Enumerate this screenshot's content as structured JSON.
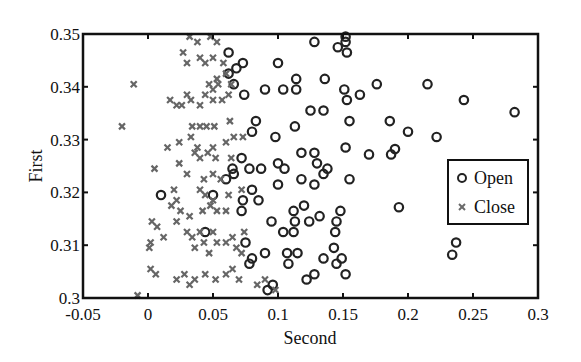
{
  "chart_data": {
    "type": "scatter",
    "title": "",
    "xlabel": "Second",
    "ylabel": "First",
    "xlim": [
      -0.05,
      0.3
    ],
    "ylim": [
      0.3,
      0.35
    ],
    "xticks": [
      -0.05,
      0,
      0.05,
      0.1,
      0.15,
      0.2,
      0.25,
      0.3
    ],
    "xtick_labels": [
      "-0.05",
      "0",
      "0.05",
      "0.1",
      "0.15",
      "0.2",
      "0.25",
      "0.3"
    ],
    "yticks": [
      0.3,
      0.31,
      0.32,
      0.33,
      0.34,
      0.35
    ],
    "ytick_labels": [
      "0.3",
      "0.31",
      "0.32",
      "0.33",
      "0.34",
      "0.35"
    ],
    "grid": false,
    "legend_position": "right-center inside",
    "legend": [
      "Open",
      "Close"
    ],
    "series": [
      {
        "name": "Open",
        "marker": "circle",
        "color": "#222222",
        "points": [
          [
            0.062,
            0.3465
          ],
          [
            0.066,
            0.3405
          ],
          [
            0.062,
            0.3425
          ],
          [
            0.073,
            0.3445
          ],
          [
            0.068,
            0.3435
          ],
          [
            0.074,
            0.3385
          ],
          [
            0.09,
            0.3395
          ],
          [
            0.104,
            0.3395
          ],
          [
            0.128,
            0.3485
          ],
          [
            0.152,
            0.3485
          ],
          [
            0.146,
            0.3475
          ],
          [
            0.152,
            0.3495
          ],
          [
            0.153,
            0.3465
          ],
          [
            0.1,
            0.3445
          ],
          [
            0.114,
            0.3415
          ],
          [
            0.114,
            0.3395
          ],
          [
            0.136,
            0.3415
          ],
          [
            0.163,
            0.3385
          ],
          [
            0.176,
            0.3405
          ],
          [
            0.151,
            0.3395
          ],
          [
            0.153,
            0.3375
          ],
          [
            0.125,
            0.3355
          ],
          [
            0.135,
            0.3355
          ],
          [
            0.155,
            0.3335
          ],
          [
            0.152,
            0.3285
          ],
          [
            0.113,
            0.3325
          ],
          [
            0.083,
            0.3335
          ],
          [
            0.098,
            0.3305
          ],
          [
            0.08,
            0.3315
          ],
          [
            0.215,
            0.3405
          ],
          [
            0.243,
            0.3375
          ],
          [
            0.282,
            0.3352
          ],
          [
            0.2,
            0.3315
          ],
          [
            0.222,
            0.3305
          ],
          [
            0.186,
            0.3335
          ],
          [
            0.17,
            0.3272
          ],
          [
            0.187,
            0.3272
          ],
          [
            0.19,
            0.3282
          ],
          [
            0.193,
            0.3172
          ],
          [
            0.237,
            0.3105
          ],
          [
            0.234,
            0.3082
          ],
          [
            0.072,
            0.3265
          ],
          [
            0.065,
            0.3245
          ],
          [
            0.078,
            0.3245
          ],
          [
            0.087,
            0.3245
          ],
          [
            0.1,
            0.3255
          ],
          [
            0.105,
            0.3245
          ],
          [
            0.118,
            0.3275
          ],
          [
            0.128,
            0.3275
          ],
          [
            0.13,
            0.3255
          ],
          [
            0.138,
            0.3245
          ],
          [
            0.118,
            0.3225
          ],
          [
            0.128,
            0.3215
          ],
          [
            0.135,
            0.3235
          ],
          [
            0.155,
            0.3225
          ],
          [
            0.08,
            0.3205
          ],
          [
            0.085,
            0.3185
          ],
          [
            0.1,
            0.3215
          ],
          [
            0.073,
            0.3185
          ],
          [
            0.072,
            0.3165
          ],
          [
            0.06,
            0.3225
          ],
          [
            0.044,
            0.3125
          ],
          [
            0.075,
            0.3105
          ],
          [
            0.08,
            0.3075
          ],
          [
            0.078,
            0.3065
          ],
          [
            0.09,
            0.3085
          ],
          [
            0.096,
            0.3025
          ],
          [
            0.092,
            0.3015
          ],
          [
            0.104,
            0.3125
          ],
          [
            0.108,
            0.3065
          ],
          [
            0.112,
            0.3165
          ],
          [
            0.113,
            0.3145
          ],
          [
            0.112,
            0.3125
          ],
          [
            0.12,
            0.3175
          ],
          [
            0.124,
            0.3145
          ],
          [
            0.107,
            0.3085
          ],
          [
            0.115,
            0.3085
          ],
          [
            0.122,
            0.3035
          ],
          [
            0.128,
            0.3045
          ],
          [
            0.135,
            0.3075
          ],
          [
            0.145,
            0.3065
          ],
          [
            0.149,
            0.3075
          ],
          [
            0.143,
            0.3095
          ],
          [
            0.148,
            0.3165
          ],
          [
            0.145,
            0.3145
          ],
          [
            0.144,
            0.3125
          ],
          [
            0.132,
            0.3155
          ],
          [
            0.152,
            0.3045
          ],
          [
            0.05,
            0.3195
          ],
          [
            0.01,
            0.3195
          ],
          [
            0.095,
            0.3145
          ],
          [
            0.066,
            0.3235
          ]
        ]
      },
      {
        "name": "Close",
        "marker": "x",
        "color": "#666666",
        "points": [
          [
            0.032,
            0.3495
          ],
          [
            0.038,
            0.3485
          ],
          [
            0.048,
            0.3495
          ],
          [
            0.053,
            0.3485
          ],
          [
            0.027,
            0.3465
          ],
          [
            0.04,
            0.3455
          ],
          [
            0.03,
            0.3445
          ],
          [
            0.05,
            0.3455
          ],
          [
            0.058,
            0.3445
          ],
          [
            0.044,
            0.3445
          ],
          [
            -0.011,
            0.3405
          ],
          [
            -0.02,
            0.3325
          ],
          [
            0.017,
            0.3375
          ],
          [
            0.022,
            0.3365
          ],
          [
            0.026,
            0.3365
          ],
          [
            0.033,
            0.3375
          ],
          [
            0.04,
            0.3365
          ],
          [
            0.053,
            0.3415
          ],
          [
            0.06,
            0.3425
          ],
          [
            0.047,
            0.3405
          ],
          [
            0.054,
            0.3405
          ],
          [
            0.05,
            0.3395
          ],
          [
            0.044,
            0.3385
          ],
          [
            0.05,
            0.3375
          ],
          [
            0.057,
            0.3375
          ],
          [
            0.062,
            0.3385
          ],
          [
            0.064,
            0.3405
          ],
          [
            0.03,
            0.3385
          ],
          [
            0.034,
            0.3325
          ],
          [
            0.04,
            0.3325
          ],
          [
            0.045,
            0.3325
          ],
          [
            0.051,
            0.3325
          ],
          [
            0.063,
            0.3335
          ],
          [
            0.033,
            0.3305
          ],
          [
            0.066,
            0.3305
          ],
          [
            0.06,
            0.3295
          ],
          [
            0.073,
            0.3305
          ],
          [
            0.038,
            0.3285
          ],
          [
            0.05,
            0.3285
          ],
          [
            0.015,
            0.3285
          ],
          [
            0.024,
            0.3295
          ],
          [
            0.036,
            0.3275
          ],
          [
            0.04,
            0.3265
          ],
          [
            0.046,
            0.3275
          ],
          [
            0.052,
            0.3265
          ],
          [
            0.064,
            0.3265
          ],
          [
            0.005,
            0.3245
          ],
          [
            0.024,
            0.3255
          ],
          [
            0.03,
            0.3235
          ],
          [
            0.043,
            0.3225
          ],
          [
            0.05,
            0.3235
          ],
          [
            0.02,
            0.3205
          ],
          [
            0.022,
            0.3185
          ],
          [
            0.018,
            0.3175
          ],
          [
            0.025,
            0.3165
          ],
          [
            0.032,
            0.3155
          ],
          [
            0.042,
            0.3165
          ],
          [
            0.053,
            0.3165
          ],
          [
            0.06,
            0.3165
          ],
          [
            0.04,
            0.3205
          ],
          [
            0.044,
            0.3195
          ],
          [
            0.05,
            0.3185
          ],
          [
            0.048,
            0.3175
          ],
          [
            0.062,
            0.3195
          ],
          [
            0.072,
            0.3205
          ],
          [
            0.056,
            0.3225
          ],
          [
            0.003,
            0.3145
          ],
          [
            0.007,
            0.3135
          ],
          [
            0.012,
            0.3115
          ],
          [
            0.002,
            0.3105
          ],
          [
            0.001,
            0.3095
          ],
          [
            0.022,
            0.3145
          ],
          [
            0.03,
            0.3125
          ],
          [
            0.034,
            0.3115
          ],
          [
            0.036,
            0.3095
          ],
          [
            0.04,
            0.3125
          ],
          [
            0.043,
            0.3105
          ],
          [
            0.047,
            0.3085
          ],
          [
            0.05,
            0.3125
          ],
          [
            0.053,
            0.3105
          ],
          [
            0.06,
            0.3105
          ],
          [
            0.065,
            0.3115
          ],
          [
            0.068,
            0.3095
          ],
          [
            0.072,
            0.3085
          ],
          [
            0.074,
            0.3125
          ],
          [
            0.002,
            0.3055
          ],
          [
            0.006,
            0.3045
          ],
          [
            0.022,
            0.3035
          ],
          [
            0.028,
            0.3045
          ],
          [
            0.032,
            0.3025
          ],
          [
            0.036,
            0.3035
          ],
          [
            0.044,
            0.3045
          ],
          [
            0.052,
            0.3035
          ],
          [
            0.06,
            0.3045
          ],
          [
            0.065,
            0.3055
          ],
          [
            0.07,
            0.3035
          ],
          [
            -0.008,
            0.3005
          ],
          [
            0.09,
            0.3035
          ],
          [
            0.098,
            0.3015
          ],
          [
            0.084,
            0.3025
          ]
        ]
      }
    ]
  },
  "colors": {
    "open_marker": "#222222",
    "close_marker": "#6a6a6a",
    "axis": "#111111",
    "background": "#ffffff"
  }
}
